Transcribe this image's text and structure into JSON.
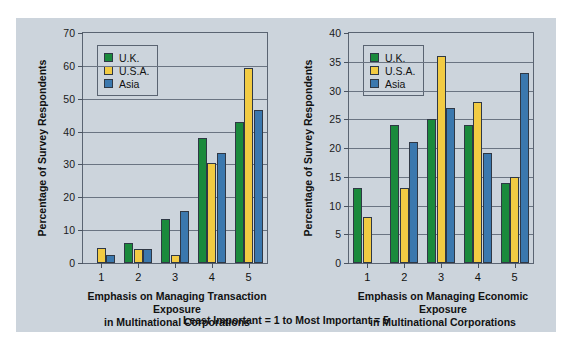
{
  "figure": {
    "background_color": "#ccd4dc",
    "caption": "Least Important = 1 to Most Important = 5"
  },
  "legend": {
    "position": "top-left-inside",
    "entries": [
      {
        "label": "U.K.",
        "color": "#1a8a3c",
        "key": "uk"
      },
      {
        "label": "U.S.A.",
        "color": "#f2cb43",
        "key": "usa"
      },
      {
        "label": "Asia",
        "color": "#3b78ae",
        "key": "asia"
      }
    ]
  },
  "chart_data": [
    {
      "id": "transaction-exposure",
      "type": "bar",
      "title": "",
      "xlabel": "Emphasis on Managing Transaction Exposure in Multinational Corporations",
      "xlabel_line1": "Emphasis on Managing Transaction Exposure",
      "xlabel_line2": "in Multinational Corporations",
      "ylabel": "Percentage of Survey Respondents",
      "categories": [
        "1",
        "2",
        "3",
        "4",
        "5"
      ],
      "ylim": [
        0,
        70
      ],
      "yticks": [
        0,
        10,
        20,
        30,
        40,
        50,
        60,
        70
      ],
      "grid": true,
      "legend_position": "upper left",
      "series": [
        {
          "name": "U.K.",
          "color": "#1a8a3c",
          "values": [
            0,
            6.0,
            13.5,
            38.0,
            43.0
          ]
        },
        {
          "name": "U.S.A.",
          "color": "#f2cb43",
          "values": [
            4.5,
            4.2,
            2.4,
            30.5,
            59.5
          ]
        },
        {
          "name": "Asia",
          "color": "#3b78ae",
          "values": [
            2.5,
            4.3,
            15.7,
            33.5,
            46.5
          ]
        }
      ]
    },
    {
      "id": "economic-exposure",
      "type": "bar",
      "title": "",
      "xlabel": "Emphasis on Managing Economic Exposure in Multinational Corporations",
      "xlabel_line1": "Emphasis on Managing Economic Exposure",
      "xlabel_line2": "in Multinational Corporations",
      "ylabel": "Percentage of Survey Respondents",
      "categories": [
        "1",
        "2",
        "3",
        "4",
        "5"
      ],
      "ylim": [
        0,
        40
      ],
      "yticks": [
        0,
        5,
        10,
        15,
        20,
        25,
        30,
        35,
        40
      ],
      "grid": true,
      "legend_position": "upper left",
      "series": [
        {
          "name": "U.K.",
          "color": "#1a8a3c",
          "values": [
            13.0,
            24.0,
            25.0,
            24.0,
            14.0
          ]
        },
        {
          "name": "U.S.A.",
          "color": "#f2cb43",
          "values": [
            8.0,
            13.0,
            36.0,
            28.0,
            15.0
          ]
        },
        {
          "name": "Asia",
          "color": "#3b78ae",
          "values": [
            0,
            21.0,
            27.0,
            19.2,
            33.0
          ]
        }
      ]
    }
  ]
}
